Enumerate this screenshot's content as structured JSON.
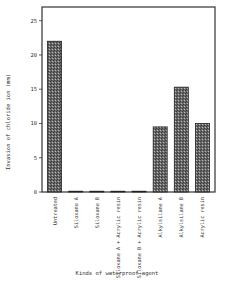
{
  "chart_data": {
    "type": "bar",
    "title": "",
    "xlabel": "Kinds of waterproof agent",
    "ylabel": "Invasion of chloride ion (mm)",
    "ylim": [
      0,
      27
    ],
    "yticks": [
      0,
      5,
      10,
      15,
      20,
      25
    ],
    "grid": false,
    "legend": null,
    "categories": [
      "Untreated",
      "Siloxane A",
      "Siloxane B",
      "Siloxane A + Acrylic resin",
      "Siloxane B + Acrylic resin",
      "Alkylsilane A",
      "Alkylsilane B",
      "Acrylic resin"
    ],
    "values": [
      22,
      0,
      0,
      0,
      0,
      9.5,
      15.3,
      10
    ],
    "bar_style": "hatched",
    "bar_color": "#555555"
  }
}
